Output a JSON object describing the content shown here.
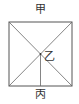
{
  "diagram": {
    "type": "square-with-diagonals",
    "labels": {
      "top": "甲",
      "center": "乙",
      "bottom": "丙"
    },
    "colors": {
      "line": "#555555",
      "text": "#333333",
      "background": "#ffffff"
    },
    "square": {
      "left": 9,
      "top": 22,
      "right": 72,
      "bottom": 86
    },
    "center_point": {
      "x": 40,
      "y": 54
    }
  }
}
